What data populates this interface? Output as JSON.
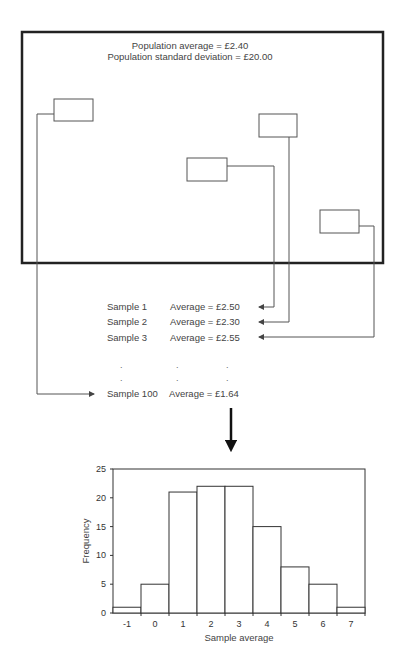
{
  "population": {
    "average_label": "Population average = £2.40",
    "sd_label": "Population standard deviation = £20.00"
  },
  "samples": [
    {
      "label": "Sample 1",
      "average": "Average = £2.50"
    },
    {
      "label": "Sample 2",
      "average": "Average = £2.30"
    },
    {
      "label": "Sample 3",
      "average": "Average = £2.55"
    },
    {
      "label": "Sample 100",
      "average": "Average = £1.64"
    }
  ],
  "ellipsis": ".",
  "chart_data": {
    "type": "bar",
    "title": "",
    "xlabel": "Sample average",
    "ylabel": "Frequency",
    "categories": [
      "-1",
      "0",
      "1",
      "2",
      "3",
      "4",
      "5",
      "6",
      "7"
    ],
    "values": [
      1,
      5,
      21,
      22,
      22,
      15,
      8,
      5,
      1
    ],
    "ylim": [
      0,
      25
    ],
    "yticks": [
      0,
      5,
      10,
      15,
      20,
      25
    ],
    "grid": false,
    "legend": "none"
  }
}
